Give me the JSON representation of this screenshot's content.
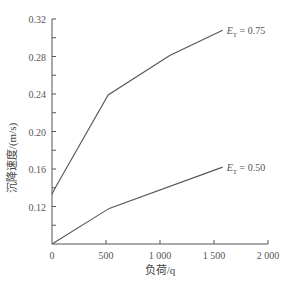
{
  "chart_data": {
    "type": "line",
    "title": "",
    "xlabel": "负荷/q",
    "ylabel": "沉降速度/(m/s)",
    "xlim": [
      0,
      2000
    ],
    "ylim": [
      0.08,
      0.32
    ],
    "xticks": [
      0,
      500,
      1000,
      1500,
      2000
    ],
    "xtick_labels": [
      "0",
      "500",
      "1 000",
      "1 500",
      "2 000"
    ],
    "yticks": [
      0.12,
      0.16,
      0.2,
      0.24,
      0.28,
      0.32
    ],
    "ytick_labels": [
      "0.12",
      "0.16",
      "0.20",
      "0.24",
      "0.28",
      "0.32"
    ],
    "grid": false,
    "series": [
      {
        "name": "E_T = 0.75",
        "label_main": "E",
        "label_sub": "T",
        "label_value": " = 0.75",
        "x": [
          0,
          30,
          520,
          1090,
          1580
        ],
        "y": [
          0.133,
          0.14,
          0.239,
          0.281,
          0.308
        ]
      },
      {
        "name": "E_T = 0.50",
        "label_main": "E",
        "label_sub": "T",
        "label_value": " = 0.50",
        "x": [
          0,
          530,
          1580
        ],
        "y": [
          0.08,
          0.118,
          0.162
        ]
      }
    ]
  }
}
